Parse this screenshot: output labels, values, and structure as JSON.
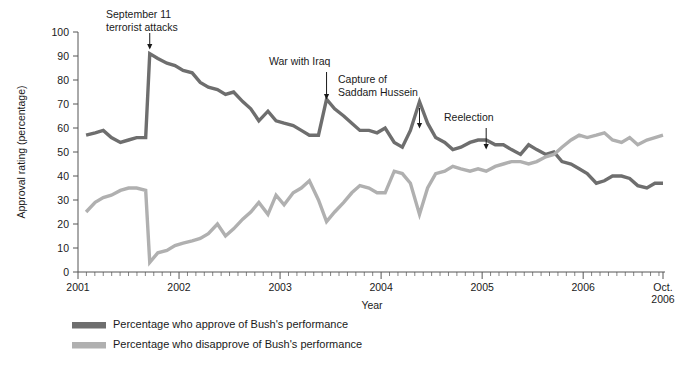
{
  "chart_data": {
    "type": "line",
    "title": "",
    "xlabel": "Year",
    "ylabel": "Approval rating (percentage)",
    "ylim": [
      0,
      100
    ],
    "ytick_step": 10,
    "yticks": [
      0,
      10,
      20,
      30,
      40,
      50,
      60,
      70,
      80,
      90,
      100
    ],
    "xlim": [
      2001.0,
      2006.79
    ],
    "xticks": [
      {
        "value": 2001,
        "label": "2001"
      },
      {
        "value": 2002,
        "label": "2002"
      },
      {
        "value": 2003,
        "label": "2003"
      },
      {
        "value": 2004,
        "label": "2004"
      },
      {
        "value": 2005,
        "label": "2005"
      },
      {
        "value": 2006,
        "label": "2006"
      },
      {
        "value": 2006.79,
        "label": "Oct.\n2006",
        "label_line1": "Oct.",
        "label_line2": "2006"
      }
    ],
    "minor_tick_interval_months": 1,
    "grid": false,
    "legend_position": "below-left",
    "series": [
      {
        "name": "Percentage who approve of Bush's performance",
        "color": "#6e6e6e",
        "x": [
          2001.08,
          2001.17,
          2001.25,
          2001.33,
          2001.42,
          2001.5,
          2001.58,
          2001.67,
          2001.71,
          2001.79,
          2001.88,
          2001.96,
          2002.04,
          2002.13,
          2002.21,
          2002.29,
          2002.38,
          2002.46,
          2002.54,
          2002.63,
          2002.71,
          2002.79,
          2002.88,
          2002.96,
          2003.04,
          2003.13,
          2003.21,
          2003.29,
          2003.38,
          2003.46,
          2003.54,
          2003.63,
          2003.71,
          2003.79,
          2003.88,
          2003.96,
          2004.04,
          2004.13,
          2004.21,
          2004.29,
          2004.38,
          2004.46,
          2004.54,
          2004.63,
          2004.71,
          2004.79,
          2004.88,
          2004.96,
          2005.04,
          2005.13,
          2005.21,
          2005.29,
          2005.38,
          2005.46,
          2005.54,
          2005.63,
          2005.71,
          2005.79,
          2005.88,
          2005.96,
          2006.04,
          2006.13,
          2006.21,
          2006.29,
          2006.38,
          2006.46,
          2006.54,
          2006.63,
          2006.71,
          2006.79
        ],
        "y": [
          57,
          58,
          59,
          56,
          54,
          55,
          56,
          56,
          91,
          89,
          87,
          86,
          84,
          83,
          79,
          77,
          76,
          74,
          75,
          71,
          68,
          63,
          67,
          63,
          62,
          61,
          59,
          57,
          57,
          72,
          68,
          65,
          62,
          59,
          59,
          58,
          60,
          54,
          52,
          59,
          71,
          62,
          56,
          54,
          51,
          52,
          54,
          55,
          55,
          53,
          53,
          51,
          49,
          53,
          51,
          49,
          50,
          46,
          45,
          43,
          41,
          37,
          38,
          40,
          40,
          39,
          36,
          35,
          37,
          37
        ],
        "endpoint_value": 37
      },
      {
        "name": "Percentage who disapprove of Bush's performance",
        "color": "#b0b0b0",
        "x": [
          2001.08,
          2001.17,
          2001.25,
          2001.33,
          2001.42,
          2001.5,
          2001.58,
          2001.67,
          2001.71,
          2001.79,
          2001.88,
          2001.96,
          2002.04,
          2002.13,
          2002.21,
          2002.29,
          2002.38,
          2002.46,
          2002.54,
          2002.63,
          2002.71,
          2002.79,
          2002.88,
          2002.96,
          2003.04,
          2003.13,
          2003.21,
          2003.29,
          2003.38,
          2003.46,
          2003.54,
          2003.63,
          2003.71,
          2003.79,
          2003.88,
          2003.96,
          2004.04,
          2004.13,
          2004.21,
          2004.29,
          2004.38,
          2004.46,
          2004.54,
          2004.63,
          2004.71,
          2004.79,
          2004.88,
          2004.96,
          2005.04,
          2005.13,
          2005.21,
          2005.29,
          2005.38,
          2005.46,
          2005.54,
          2005.63,
          2005.71,
          2005.79,
          2005.88,
          2005.96,
          2006.04,
          2006.13,
          2006.21,
          2006.29,
          2006.38,
          2006.46,
          2006.54,
          2006.63,
          2006.71,
          2006.79
        ],
        "y": [
          25,
          29,
          31,
          32,
          34,
          35,
          35,
          34,
          4,
          8,
          9,
          11,
          12,
          13,
          14,
          16,
          20,
          15,
          18,
          22,
          25,
          29,
          24,
          32,
          28,
          33,
          35,
          38,
          30,
          21,
          25,
          29,
          33,
          36,
          35,
          33,
          33,
          42,
          41,
          37,
          24,
          35,
          41,
          42,
          44,
          43,
          42,
          43,
          42,
          44,
          45,
          46,
          46,
          45,
          46,
          48,
          49,
          52,
          55,
          57,
          56,
          57,
          58,
          55,
          54,
          56,
          53,
          55,
          56,
          57
        ],
        "endpoint_value": 57
      }
    ],
    "annotations": [
      {
        "id": "september-11",
        "text": "September 11\nterrorist attacks",
        "line1": "September 11",
        "line2": "terrorist attacks",
        "x": 2001.71,
        "y": 91
      },
      {
        "id": "war-with-iraq",
        "text": "War with Iraq",
        "line1": "War with Iraq",
        "line2": "",
        "x": 2003.46,
        "y": 72
      },
      {
        "id": "capture-of-saddam-hussein",
        "text": "Capture of\nSaddam Hussein",
        "line1": "Capture of",
        "line2": "Saddam Hussein",
        "x": 2004.38,
        "y": 71
      },
      {
        "id": "reelection",
        "text": "Reelection",
        "line1": "Reelection",
        "line2": "",
        "x": 2005.04,
        "y": 55
      }
    ]
  },
  "axes": {
    "y_title": "Approval rating (percentage)",
    "x_title": "Year"
  },
  "legend": {
    "items": [
      {
        "label": "Percentage who approve of Bush's performance",
        "color": "#6e6e6e"
      },
      {
        "label": "Percentage who disapprove of Bush's performance",
        "color": "#b0b0b0"
      }
    ]
  },
  "colors": {
    "approve": "#6e6e6e",
    "disapprove": "#b0b0b0",
    "axis": "#555555",
    "text": "#1a1a1a",
    "background": "#ffffff"
  }
}
